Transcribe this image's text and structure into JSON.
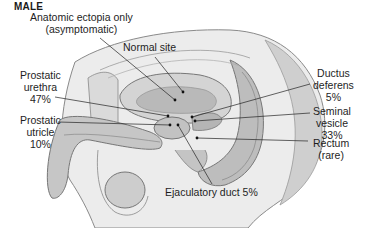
{
  "figure": {
    "title": "MALE",
    "labels": {
      "anatomic_ectopia": {
        "line1": "Anatomic ectopia only",
        "line2": "(asymptomatic)"
      },
      "normal_site": {
        "line1": "Normal site"
      },
      "prostatic_urethra": {
        "line1": "Prostatic",
        "line2": "urethra",
        "line3": "47%"
      },
      "prostatic_utricle": {
        "line1": "Prostatic",
        "line2": "utricle",
        "line3": "10%"
      },
      "ductus_deferens": {
        "line1": "Ductus",
        "line2": "deferens",
        "line3": "5%"
      },
      "seminal_vesicle": {
        "line1": "Seminal",
        "line2": "vesicle",
        "line3": "33%"
      },
      "rectum": {
        "line1": "Rectum",
        "line2": "(rare)"
      },
      "ejaculatory_duct": {
        "line1": "Ejaculatory duct 5%"
      }
    },
    "colors": {
      "background": "#ffffff",
      "tissue_light": "#e6e6e6",
      "tissue_mid": "#c8c8c8",
      "tissue_dark": "#9a9a9a",
      "outline": "#6e6e6e",
      "leader_line": "#222222"
    }
  }
}
